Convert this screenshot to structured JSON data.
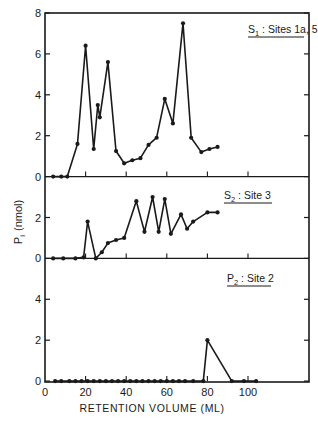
{
  "chart_data": {
    "type": "line",
    "layout": "three vertically stacked panels sharing x-axis",
    "xlabel": "RETENTION VOLUME (ML)",
    "ylabel": "P",
    "ylabel_sub": "i",
    "ylabel_unit": "(nmol)",
    "xlim": [
      0,
      130
    ],
    "xticks": [
      0,
      20,
      40,
      60,
      80,
      100
    ],
    "xtick_labels": [
      "0",
      "20",
      "40",
      "60",
      "80",
      "100"
    ],
    "grid": false,
    "panels": [
      {
        "name": "S1",
        "legend_main": "S",
        "legend_sub": "1",
        "legend_rest": ": Sites 1a, 5, 1b",
        "ylim": [
          0,
          8
        ],
        "yticks": [
          0,
          2,
          4,
          6,
          8
        ],
        "ytick_labels": [
          "0",
          "2",
          "4",
          "6",
          "8"
        ],
        "x": [
          4,
          8,
          11,
          16,
          20,
          24,
          26,
          27,
          31,
          35,
          39,
          43,
          47,
          51,
          55,
          59,
          63,
          68,
          72,
          77,
          81,
          85
        ],
        "y": [
          0,
          0,
          0,
          1.6,
          6.4,
          1.35,
          3.5,
          2.9,
          5.6,
          1.25,
          0.65,
          0.8,
          0.9,
          1.55,
          1.9,
          3.8,
          2.6,
          7.5,
          1.9,
          1.2,
          1.35,
          1.45
        ]
      },
      {
        "name": "S2",
        "legend_main": "S",
        "legend_sub": "2",
        "legend_rest": ": Site 3",
        "ylim": [
          0,
          4
        ],
        "yticks": [
          0,
          2
        ],
        "ytick_labels": [
          "0",
          "2"
        ],
        "x": [
          4,
          9,
          15,
          19,
          21,
          25,
          28,
          31,
          35,
          39,
          45,
          49,
          53,
          56,
          59,
          62,
          67,
          70,
          73,
          80,
          85
        ],
        "y": [
          0,
          0,
          0,
          0.05,
          1.8,
          0,
          0.3,
          0.75,
          0.9,
          1.0,
          2.8,
          1.3,
          3.0,
          1.3,
          2.9,
          1.2,
          2.15,
          1.45,
          1.8,
          2.25,
          2.25
        ]
      },
      {
        "name": "P2",
        "legend_main": "P",
        "legend_sub": "2",
        "legend_rest": ": Site 2",
        "ylim": [
          0,
          6
        ],
        "yticks": [
          0,
          2,
          4
        ],
        "ytick_labels": [
          "0",
          "2",
          "4"
        ],
        "x": [
          5,
          8,
          12,
          15,
          18,
          21,
          24,
          27,
          30,
          33,
          36,
          39,
          42,
          45,
          48,
          51,
          54,
          57,
          60,
          63,
          66,
          69,
          73,
          78,
          80,
          92,
          98,
          104
        ],
        "y": [
          0,
          0,
          0,
          0,
          0,
          0,
          0,
          0,
          0,
          0,
          0,
          0,
          0,
          0,
          0,
          0,
          0,
          0,
          0,
          0,
          0,
          0,
          0,
          0,
          2.0,
          0,
          0,
          0
        ]
      }
    ]
  },
  "colors": {
    "ink": "#1a1a1a",
    "background": "#ffffff"
  }
}
